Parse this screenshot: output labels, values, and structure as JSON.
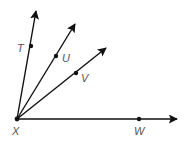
{
  "diagram": {
    "type": "rays-from-common-vertex",
    "vertex": {
      "label": "X",
      "x": 17,
      "y": 119,
      "label_x": 12,
      "label_y": 135
    },
    "rays": [
      {
        "name": "XT",
        "point_label": "T",
        "tip": [
          36,
          11
        ],
        "point": [
          31,
          46
        ],
        "label_pos": [
          17,
          52
        ]
      },
      {
        "name": "XU",
        "point_label": "U",
        "tip": [
          75,
          24
        ],
        "point": [
          56,
          56
        ],
        "label_pos": [
          62,
          62
        ]
      },
      {
        "name": "XV",
        "point_label": "V",
        "tip": [
          106,
          48
        ],
        "point": [
          76,
          73
        ],
        "label_pos": [
          81,
          82
        ]
      },
      {
        "name": "XW",
        "point_label": "W",
        "tip": [
          177,
          119
        ],
        "point": [
          139,
          119
        ],
        "label_pos": [
          134,
          135
        ]
      }
    ],
    "colors": {
      "line": "#111111",
      "label": "#555555",
      "background": "#ffffff"
    }
  }
}
